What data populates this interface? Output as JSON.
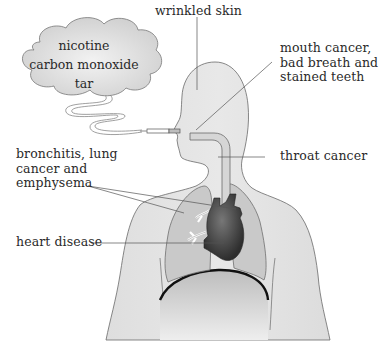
{
  "diagram": {
    "cloud": {
      "items": [
        "nicotine",
        "carbon monoxide",
        "tar"
      ]
    },
    "labels": {
      "wrinkled_skin": "wrinkled skin",
      "mouth_cancer": "mouth cancer,\nbad breath and\nstained teeth",
      "throat_cancer": "throat cancer",
      "lungs": "bronchitis, lung\ncancer and\nemphysema",
      "heart_disease": "heart disease"
    },
    "colors": {
      "body_fill": "#e2e2e2",
      "lung_fill": "#c9c9c9",
      "heart_fill": "#3a3a3a",
      "cloud_fill": "#dcdcdc",
      "line": "#555555",
      "text": "#2a2a2a"
    }
  }
}
